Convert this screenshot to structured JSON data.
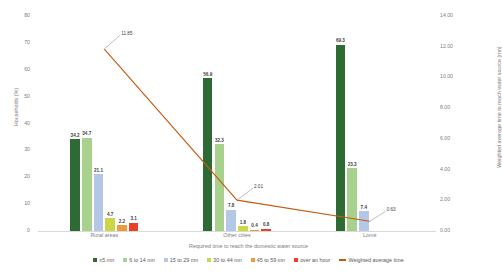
{
  "chart_data": {
    "type": "bar",
    "title": "",
    "xlabel": "Required time to reach the domestic water source",
    "ylabel": "Households (%)",
    "y2label": "Weighted average time to reach water source (mn)",
    "categories": [
      "Rural areas",
      "Other cities",
      "Lomé"
    ],
    "ylim": [
      0,
      80
    ],
    "y2lim": [
      0,
      14
    ],
    "ytick_labels": [
      "0",
      "10",
      "20",
      "30",
      "40",
      "50",
      "60",
      "70",
      "80"
    ],
    "y2tick_labels": [
      "0.00",
      "2.00",
      "4.00",
      "6.00",
      "8.00",
      "10.00",
      "12.00",
      "14.00"
    ],
    "grid": false,
    "legend_position": "bottom",
    "series": [
      {
        "name": "≤5  mn",
        "type": "bar",
        "color": "#2e6b34",
        "values": [
          34.2,
          56.9,
          69.3
        ],
        "labels": [
          "34.2",
          "56.9",
          "69.3"
        ]
      },
      {
        "name": "6 to 14 mn",
        "type": "bar",
        "color": "#a9d18e",
        "values": [
          34.7,
          32.3,
          23.3
        ],
        "labels": [
          "34.7",
          "32.3",
          "23.3"
        ]
      },
      {
        "name": "15 to 29 mn",
        "type": "bar",
        "color": "#b4c7e7",
        "values": [
          21.1,
          7.8,
          7.4
        ],
        "labels": [
          "21.1",
          "7.8",
          "7.4"
        ]
      },
      {
        "name": "30 to 44 mn",
        "type": "bar",
        "color": "#c9d844",
        "values": [
          4.7,
          1.8,
          0.0
        ],
        "labels": [
          "4.7",
          "1.8",
          ""
        ]
      },
      {
        "name": "45 to 59 mn",
        "type": "bar",
        "color": "#ed9b3f",
        "values": [
          2.2,
          0.4,
          0.0
        ],
        "labels": [
          "2.2",
          "0.4",
          ""
        ]
      },
      {
        "name": "over an hour",
        "type": "bar",
        "color": "#e8402a",
        "values": [
          3.1,
          0.8,
          0.0
        ],
        "labels": [
          "3.1",
          "0.8",
          ""
        ]
      },
      {
        "name": "Weighted average time",
        "type": "line",
        "color": "#c55a11",
        "values": [
          11.85,
          2.01,
          0.63
        ],
        "labels": [
          "11.85",
          "2.01",
          "0.63"
        ]
      }
    ]
  },
  "legend": {
    "items": [
      {
        "label": "≤5  mn",
        "color": "#2e6b34",
        "kind": "swatch"
      },
      {
        "label": "6 to 14 mn",
        "color": "#a9d18e",
        "kind": "swatch"
      },
      {
        "label": "15 to 29 mn",
        "color": "#b4c7e7",
        "kind": "swatch"
      },
      {
        "label": "30 to 44 mn",
        "color": "#c9d844",
        "kind": "swatch"
      },
      {
        "label": "45 to 59 mn",
        "color": "#ed9b3f",
        "kind": "swatch"
      },
      {
        "label": "over an hour",
        "color": "#e8402a",
        "kind": "swatch"
      },
      {
        "label": "Weighted average time",
        "color": "#c55a11",
        "kind": "line"
      }
    ]
  }
}
